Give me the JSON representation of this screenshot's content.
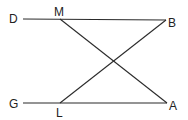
{
  "diagram": {
    "type": "geometry",
    "points": {
      "D": {
        "label": "D",
        "x": 23,
        "y": 19
      },
      "M": {
        "label": "M",
        "x": 60,
        "y": 19
      },
      "B": {
        "label": "B",
        "x": 166,
        "y": 20
      },
      "G": {
        "label": "G",
        "x": 23,
        "y": 103
      },
      "L": {
        "label": "L",
        "x": 60,
        "y": 103
      },
      "A": {
        "label": "A",
        "x": 167,
        "y": 103
      }
    },
    "segments": [
      {
        "from": "D",
        "to": "B"
      },
      {
        "from": "G",
        "to": "A"
      },
      {
        "from": "M",
        "to": "A"
      },
      {
        "from": "L",
        "to": "B"
      }
    ],
    "labels": {
      "D": "D",
      "M": "M",
      "B": "B",
      "G": "G",
      "L": "L",
      "A": "A"
    },
    "line_color": "#2a2a2a",
    "text_color": "#222222"
  }
}
